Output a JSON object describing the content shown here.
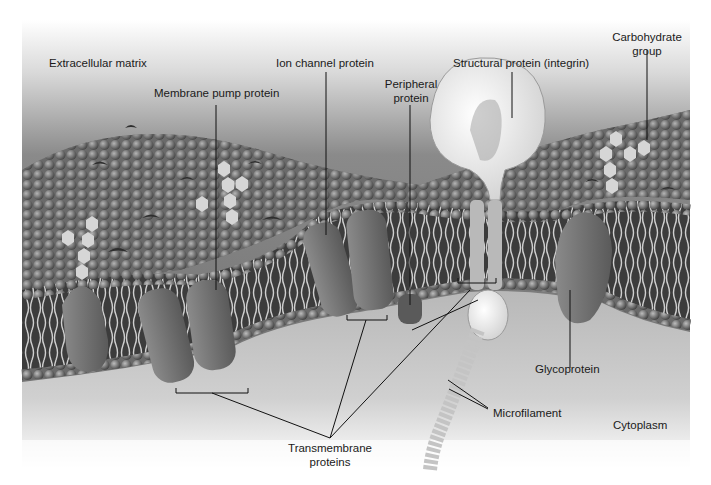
{
  "diagram": {
    "style": "grayscale illustration",
    "colors": {
      "background_top": "#ffffff",
      "matrix_gray": "#7a7a7a",
      "membrane_dark": "#4a4a4a",
      "protein_gray": "#6e6e6e",
      "integrin_light": "#e6e6e6",
      "cytoplasm": "#c8c8c8",
      "label_text": "#1a1a1a",
      "leader_line": "#111111"
    },
    "labels": {
      "extracellular_matrix": "Extracellular matrix",
      "membrane_pump_protein": "Membrane pump protein",
      "ion_channel_protein": "Ion channel protein",
      "peripheral_protein_line1": "Peripheral",
      "peripheral_protein_line2": "protein",
      "structural_protein": "Structural protein (integrin)",
      "carbohydrate_group_line1": "Carbohydrate",
      "carbohydrate_group_line2": "group",
      "glycoprotein": "Glycoprotein",
      "microfilament": "Microfilament",
      "cytoplasm": "Cytoplasm",
      "transmembrane_proteins_line1": "Transmembrane",
      "transmembrane_proteins_line2": "proteins"
    }
  }
}
